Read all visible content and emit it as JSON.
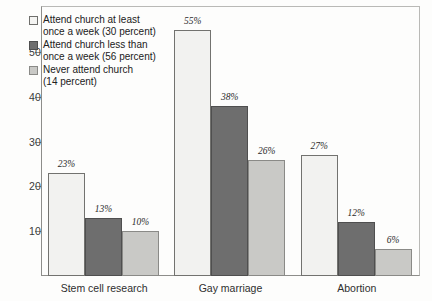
{
  "chart_data": {
    "type": "bar",
    "title": "",
    "subtitle": "",
    "xlabel": "",
    "ylabel": "",
    "categories": [
      "Stem cell research",
      "Gay marriage",
      "Abortion"
    ],
    "series": [
      {
        "name": "Attend church at least once a week (30 percent)",
        "legend_line1": "Attend church at least",
        "legend_line2": "once a week (30 percent)",
        "color": "#f2f2f0",
        "values": [
          23,
          55,
          27
        ],
        "labels": [
          "23%",
          "55%",
          "27%"
        ]
      },
      {
        "name": "Attend church less than once a week (56 percent)",
        "legend_line1": "Attend church less than",
        "legend_line2": "once a week (56 percent)",
        "color": "#6e6e6e",
        "values": [
          13,
          38,
          12
        ],
        "labels": [
          "13%",
          "38%",
          "12%"
        ]
      },
      {
        "name": "Never attend church (14 percent)",
        "legend_line1": "Never attend church",
        "legend_line2": "(14 percent)",
        "color": "#c9c9c6",
        "values": [
          10,
          26,
          6
        ],
        "labels": [
          "10%",
          "26%",
          "6%"
        ]
      }
    ],
    "yticks": [
      10,
      20,
      30,
      40,
      50
    ],
    "ytick_labels": [
      "10",
      "20",
      "30",
      "40",
      "50"
    ],
    "ylim": [
      0,
      60
    ],
    "grid": false,
    "legend_position": "top-left",
    "value_labels_shown": true,
    "axis_color": "#8d8d8a",
    "frame_color": "#b9b9b6"
  }
}
